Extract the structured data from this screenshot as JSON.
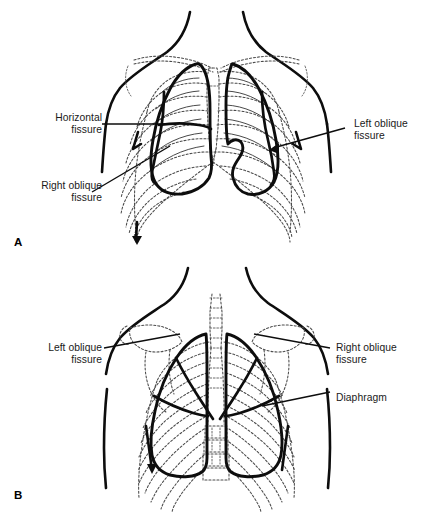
{
  "figure": {
    "background_color": "#ffffff",
    "line_color": "#0d0d0d",
    "bone_color": "#4a4a4a"
  },
  "panels": [
    {
      "letter": "A",
      "view": "anterior",
      "labels": [
        {
          "id": "horizontal-fissure",
          "text": "Horizontal\nfissure",
          "align": "right"
        },
        {
          "id": "right-oblique-fissure",
          "text": "Right oblique\nfissure",
          "align": "right"
        },
        {
          "id": "left-oblique-fissure",
          "text": "Left oblique\nfissure",
          "align": "left"
        }
      ]
    },
    {
      "letter": "B",
      "view": "posterior",
      "labels": [
        {
          "id": "left-oblique-fissure",
          "text": "Left oblique\nfissure",
          "align": "right"
        },
        {
          "id": "right-oblique-fissure",
          "text": "Right oblique\nfissure",
          "align": "left"
        },
        {
          "id": "diaphragm",
          "text": "Diaphragm",
          "align": "left"
        }
      ]
    }
  ]
}
